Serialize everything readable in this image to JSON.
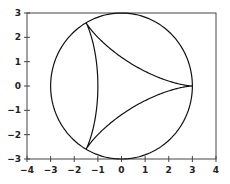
{
  "chart_data": {
    "type": "line",
    "title": "",
    "xlabel": "",
    "ylabel": "",
    "xlim": [
      -4,
      4
    ],
    "ylim": [
      -3,
      3
    ],
    "grid": false,
    "legend": null,
    "x_ticks": [
      "-4",
      "-3",
      "-2",
      "-1",
      "0",
      "1",
      "2",
      "3",
      "4"
    ],
    "y_ticks": [
      "-3",
      "-2",
      "-1",
      "0",
      "1",
      "2",
      "3"
    ],
    "series": [
      {
        "name": "circle",
        "description": "Circle of radius 3 centered at origin",
        "center": [
          0,
          0
        ],
        "radius": 3
      },
      {
        "name": "deltoid",
        "description": "Three-cusped hypocycloid (deltoid) inscribed in circle, cusps at (3,0), (-1.5,2.598), (-1.5,-2.598)",
        "cusps": [
          [
            3,
            0
          ],
          [
            -1.5,
            2.598
          ],
          [
            -1.5,
            -2.598
          ]
        ]
      }
    ]
  }
}
